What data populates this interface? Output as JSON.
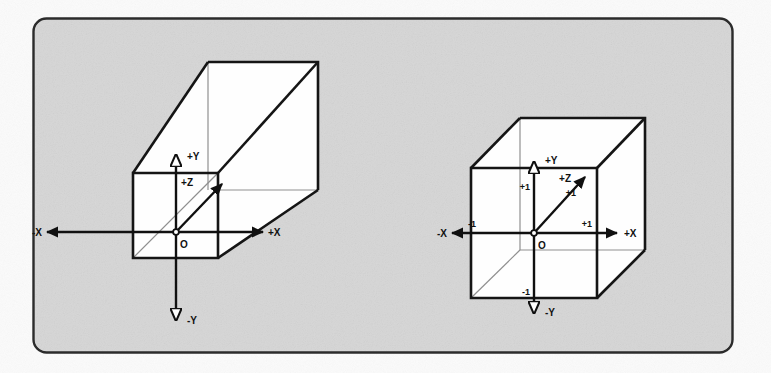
{
  "figure": {
    "panel": {
      "background_color": "#d4d4d4",
      "border_color": "#2b2b2b",
      "page_background": "#ffffff"
    },
    "stroke_colors": {
      "outline": "#151515",
      "hidden_edge": "#8a8a8a",
      "axis": "#101010"
    }
  },
  "diagrams": [
    {
      "id": "frustum",
      "name": "view-frustum-diagram",
      "origin_label": "O",
      "axes": [
        {
          "name": "y-axis-positive",
          "label": "+Y"
        },
        {
          "name": "y-axis-negative",
          "label": "-Y"
        },
        {
          "name": "x-axis-positive",
          "label": "+X"
        },
        {
          "name": "x-axis-negative",
          "label": "-X"
        },
        {
          "name": "z-axis-positive",
          "label": "+Z"
        }
      ],
      "tick_labels": []
    },
    {
      "id": "normalized-cube",
      "name": "normalized-cube-diagram",
      "origin_label": "O",
      "axes": [
        {
          "name": "y-axis-positive",
          "label": "+Y"
        },
        {
          "name": "y-axis-negative",
          "label": "-Y"
        },
        {
          "name": "x-axis-positive",
          "label": "+X"
        },
        {
          "name": "x-axis-negative",
          "label": "-X"
        },
        {
          "name": "z-axis-positive",
          "label": "+Z"
        }
      ],
      "tick_labels": [
        {
          "name": "y-positive-tick",
          "label": "+1"
        },
        {
          "name": "y-negative-tick",
          "label": "-1"
        },
        {
          "name": "x-positive-tick",
          "label": "+1"
        },
        {
          "name": "x-negative-tick",
          "label": "-1"
        },
        {
          "name": "z-positive-tick",
          "label": "+1"
        }
      ]
    }
  ]
}
